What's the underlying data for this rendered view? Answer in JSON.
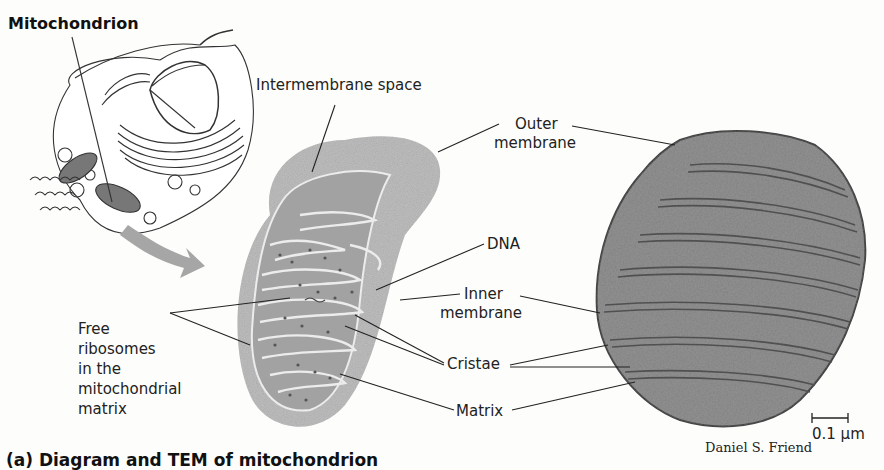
{
  "figure": {
    "title": "Mitochondrion",
    "caption": "(a) Diagram and TEM of mitochondrion",
    "credit": "Daniel S. Friend",
    "scale_bar": "0.1 µm"
  },
  "labels": {
    "intermembrane_space": "Intermembrane space",
    "outer_membrane_1": "Outer",
    "outer_membrane_2": "membrane",
    "dna": "DNA",
    "inner_membrane_1": "Inner",
    "inner_membrane_2": "membrane",
    "cristae": "Cristae",
    "matrix": "Matrix",
    "free_ribosomes": [
      "Free",
      "ribosomes",
      "in the",
      "mitochondrial",
      "matrix"
    ]
  },
  "colors": {
    "outer_fill": "#b3b3b3",
    "inner_fill": "#9d9d9d",
    "membrane_line": "#e8e8e8",
    "arrow": "#a6a6a6",
    "tem_fill": "#8a8a8a",
    "tem_edge": "#4a4a4a"
  }
}
